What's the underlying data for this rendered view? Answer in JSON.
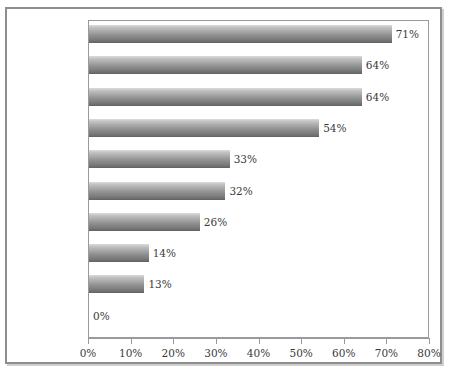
{
  "chart_data": {
    "type": "bar",
    "orientation": "horizontal",
    "title": "",
    "subtitle": "",
    "xlabel": "",
    "ylabel": "",
    "xlim": [
      0,
      80
    ],
    "grid": false,
    "legend": null,
    "value_suffix": "%",
    "categories": [
      "Task Oriented",
      "Goal Oriented",
      "Team Player",
      "Relationship Oriented",
      "Delegator Oriented",
      "Suggestion Oriented",
      "Dream Oriented",
      "Organization Oriented",
      "Knowledge Oriented",
      "Loner Oriented"
    ],
    "category_lines": [
      [
        "Task",
        "Oriented"
      ],
      [
        "Goal",
        "Oriented"
      ],
      [
        "Team Player",
        ""
      ],
      [
        "Relationship",
        "Oriented"
      ],
      [
        "Delegator",
        "Oriented"
      ],
      [
        "Suggestion",
        "Oriented"
      ],
      [
        "Dream",
        "Oriented"
      ],
      [
        "Organization",
        "Oriented"
      ],
      [
        "Knowledge",
        "Oriented"
      ],
      [
        "Loner",
        "Oriented"
      ]
    ],
    "values": [
      71,
      64,
      64,
      54,
      33,
      32,
      26,
      14,
      13,
      0
    ],
    "value_labels": [
      "71%",
      "64%",
      "64%",
      "54%",
      "33%",
      "32%",
      "26%",
      "14%",
      "13%",
      "0%"
    ],
    "xticks": [
      0,
      10,
      20,
      30,
      40,
      50,
      60,
      70,
      80
    ],
    "xtick_labels": [
      "0%",
      "10%",
      "20%",
      "30%",
      "40%",
      "50%",
      "60%",
      "70%",
      "80%"
    ],
    "colors": {
      "bar_gradient_top": "#dcdcdc",
      "bar_gradient_bottom": "#5f5f5f",
      "text": "#3a3a3a",
      "axis": "#9a9a9a",
      "frame": "#8e8e8e",
      "background": "#ffffff"
    }
  }
}
